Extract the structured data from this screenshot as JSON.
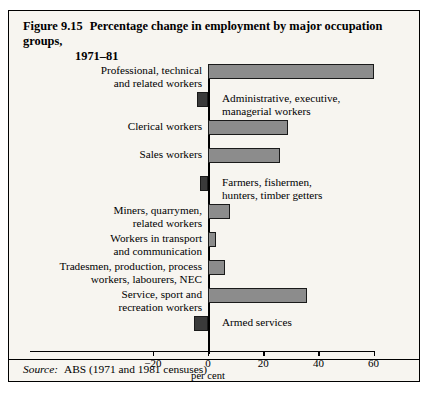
{
  "figure": {
    "number": "Figure 9.15",
    "title_line1": "Percentage change in employment by major occupation groups,",
    "title_line2": "1971–81",
    "source_word": "Source:",
    "source_text": "ABS (1971 and 1981 censuses)"
  },
  "chart_data": {
    "type": "bar",
    "orientation": "horizontal",
    "xlabel": "per cent",
    "ylabel": "",
    "xlim": [
      -20,
      60
    ],
    "xticks": [
      -20,
      0,
      20,
      40,
      60
    ],
    "xtick_labels": [
      "−20",
      "0",
      "20",
      "40",
      "60"
    ],
    "grid": false,
    "legend": null,
    "source": "ABS (1971 and 1981 censuses)",
    "categories": [
      "Professional, technical\nand related workers",
      "Administrative, executive,\nmanagerial workers",
      "Clerical workers",
      "Sales workers",
      "Farmers, fishermen,\nhunters, timber getters",
      "Miners, quarrymen,\nrelated workers",
      "Workers in transport\nand communication",
      "Tradesmen, production, process\nworkers, labourers, NEC",
      "Service, sport and\nrecreation workers",
      "Armed services"
    ],
    "values": [
      60,
      -4,
      29,
      26,
      -3,
      8,
      3,
      6,
      36,
      -5
    ],
    "bars": [
      {
        "label": "Professional, technical\nand related workers",
        "value": 60,
        "label_side": "left"
      },
      {
        "label": "Administrative, executive,\nmanagerial workers",
        "value": -4,
        "label_side": "inside"
      },
      {
        "label": "Clerical workers",
        "value": 29,
        "label_side": "left"
      },
      {
        "label": "Sales workers",
        "value": 26,
        "label_side": "left"
      },
      {
        "label": "Farmers, fishermen,\nhunters, timber getters",
        "value": -3,
        "label_side": "inside"
      },
      {
        "label": "Miners, quarrymen,\nrelated workers",
        "value": 8,
        "label_side": "left"
      },
      {
        "label": "Workers in transport\nand communication",
        "value": 3,
        "label_side": "left"
      },
      {
        "label": "Tradesmen, production, process\nworkers, labourers, NEC",
        "value": 6,
        "label_side": "left"
      },
      {
        "label": "Service, sport and\nrecreation workers",
        "value": 36,
        "label_side": "left"
      },
      {
        "label": "Armed services",
        "value": -5,
        "label_side": "inside"
      }
    ],
    "colors": {
      "bar_positive": "#8c8c8c",
      "bar_negative": "#3a3a3a",
      "bar_border": "#1a1a1a",
      "axis": "#000000",
      "background": "#f7f5f0",
      "frame": "#000000"
    }
  }
}
